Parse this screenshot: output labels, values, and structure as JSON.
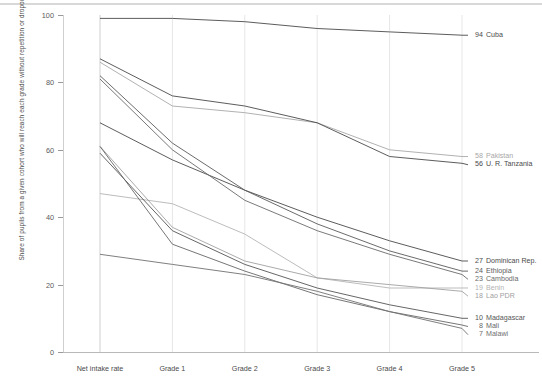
{
  "chart_data": {
    "type": "line",
    "title": "",
    "subtitle": "",
    "xlabel": "",
    "ylabel": "Share of pupils from a given cohort who will reach each grade without repetition or dropout (%)",
    "categories": [
      "Net intake rate",
      "Grade 1",
      "Grade 2",
      "Grade 3",
      "Grade 4",
      "Grade 5"
    ],
    "ylim": [
      0,
      100
    ],
    "yticks": [
      0,
      20,
      40,
      60,
      80,
      100
    ],
    "grid": "vertical",
    "legend": "right-endpoint-labels",
    "series": [
      {
        "name": "Cuba",
        "end_value": 94,
        "color": "#4a4a4a",
        "values": [
          99,
          99,
          98,
          96,
          95,
          94
        ]
      },
      {
        "name": "Pakistan",
        "end_value": 58,
        "color": "#a8a8a8",
        "values": [
          86,
          73,
          71,
          68,
          60,
          58
        ]
      },
      {
        "name": "U. R. Tanzania",
        "end_value": 56,
        "color": "#4a4a4a",
        "values": [
          87,
          76,
          73,
          68,
          58,
          56
        ]
      },
      {
        "name": "Dominican Rep.",
        "end_value": 27,
        "color": "#4a4a4a",
        "values": [
          68,
          57,
          48,
          40,
          33,
          27
        ]
      },
      {
        "name": "Ethiopia",
        "end_value": 24,
        "color": "#5a5a5a",
        "values": [
          82,
          62,
          48,
          38,
          30,
          24
        ]
      },
      {
        "name": "Cambodia",
        "end_value": 23,
        "color": "#6a6a6a",
        "values": [
          81,
          60,
          45,
          36,
          29,
          23
        ]
      },
      {
        "name": "Benin",
        "end_value": 19,
        "color": "#b4b4b4",
        "values": [
          47,
          44,
          35,
          22,
          19,
          19
        ]
      },
      {
        "name": "Lao PDR",
        "end_value": 18,
        "color": "#a0a0a0",
        "values": [
          61,
          37,
          27,
          22,
          20,
          18
        ]
      },
      {
        "name": "Madagascar",
        "end_value": 10,
        "color": "#555555",
        "values": [
          59,
          36,
          26,
          19,
          14,
          10
        ]
      },
      {
        "name": "Mali",
        "end_value": 8,
        "color": "#676767",
        "values": [
          61,
          32,
          24,
          17,
          12,
          8
        ]
      },
      {
        "name": "Malawi",
        "end_value": 7,
        "color": "#707070",
        "values": [
          29,
          26,
          23,
          18,
          12,
          7
        ]
      }
    ]
  },
  "axes": {
    "y_title": "Share of pupils from a given cohort who will reach each grade without repetition or dropout (%)",
    "y_ticks": [
      "100",
      "80",
      "60",
      "40",
      "20",
      "0"
    ],
    "x_ticks": [
      "Net intake rate",
      "Grade 1",
      "Grade 2",
      "Grade 3",
      "Grade 4",
      "Grade 5"
    ]
  },
  "labels": [
    {
      "value": "94",
      "name": "Cuba"
    },
    {
      "value": "58",
      "name": "Pakistan"
    },
    {
      "value": "56",
      "name": "U. R. Tanzania"
    },
    {
      "value": "27",
      "name": "Dominican Rep."
    },
    {
      "value": "24",
      "name": "Ethiopia"
    },
    {
      "value": "23",
      "name": "Cambodia"
    },
    {
      "value": "19",
      "name": "Benin"
    },
    {
      "value": "18",
      "name": "Lao PDR"
    },
    {
      "value": "10",
      "name": "Madagascar"
    },
    {
      "value": "8",
      "name": "Mali"
    },
    {
      "value": "7",
      "name": "Malawi"
    }
  ]
}
